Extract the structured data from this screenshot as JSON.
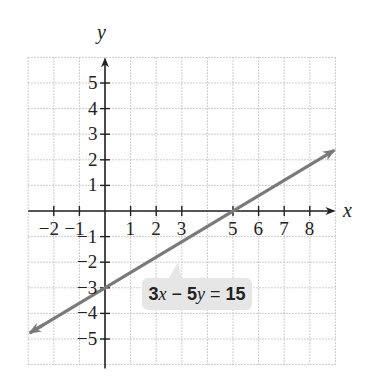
{
  "chart_data": {
    "type": "line",
    "title": "",
    "xlabel": "x",
    "ylabel": "y",
    "xlim": [
      -3,
      9
    ],
    "ylim": [
      -6,
      6
    ],
    "grid": true,
    "grid_style": "dotted",
    "x_ticks": [
      -2,
      -1,
      1,
      2,
      3,
      5,
      6,
      7,
      8
    ],
    "x_tick_labels": [
      "−2",
      "−1",
      "1",
      "2",
      "3",
      "5",
      "6",
      "7",
      "8"
    ],
    "y_ticks": [
      5,
      4,
      3,
      2,
      1,
      -1,
      -2,
      -3,
      -4,
      -5
    ],
    "y_tick_labels": [
      "5",
      "4",
      "3",
      "2",
      "1",
      "−1",
      "−2",
      "−3",
      "−4",
      "−5"
    ],
    "series": [
      {
        "name": "3x − 5y = 15",
        "equation": "3x - 5y = 15",
        "slope": 0.6,
        "intercept": -3,
        "x": [
          -2.9,
          0,
          5,
          9
        ],
        "y": [
          -4.74,
          -3,
          0,
          2.4
        ],
        "color": "#7a7a7a",
        "arrows": "both"
      }
    ],
    "annotations": [
      {
        "text": "3x − 5y = 15",
        "parts": {
          "a": "3",
          "x": "x",
          "minus": " − ",
          "b": "5",
          "y": "y",
          "eq": " = ",
          "c": "15"
        },
        "points_to": [
          3,
          -1.2
        ]
      }
    ],
    "intercepts": {
      "x_intercept": [
        5,
        0
      ],
      "y_intercept": [
        0,
        -3
      ]
    }
  },
  "colors": {
    "line": "#7a7a7a",
    "axis": "#222222",
    "grid": "#bdbdbd",
    "label_bg": "#e6e6e6"
  }
}
